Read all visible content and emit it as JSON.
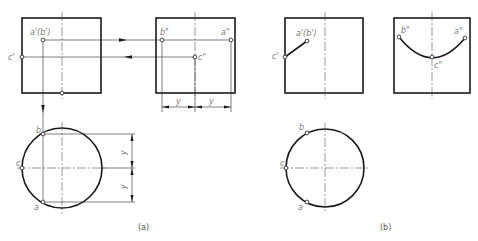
{
  "figure": {
    "panel_a": {
      "caption": "(a)",
      "front_view": {
        "points": {
          "a_prime_b_prime": "a'(b')",
          "c_prime": "c'"
        }
      },
      "side_view": {
        "points": {
          "b_dprime": "b\"",
          "a_dprime": "a\"",
          "c_dprime": "c\""
        },
        "dimensions": [
          "y",
          "y"
        ]
      },
      "top_view": {
        "points": {
          "a": "a",
          "b": "b",
          "c": "c"
        },
        "dimensions": [
          "y",
          "y"
        ]
      }
    },
    "panel_b": {
      "caption": "(b)",
      "front_view": {
        "points": {
          "a_prime_b_prime": "a'(b')",
          "c_prime": "c'"
        }
      },
      "side_view": {
        "points": {
          "b_dprime": "b\"",
          "a_dprime": "a\"",
          "c_dprime": "c\""
        }
      },
      "top_view": {
        "points": {
          "a": "a",
          "b": "b",
          "c": "c"
        }
      }
    },
    "colors": {
      "line": "#1a1a1a",
      "label": "#7a7a7a"
    }
  }
}
